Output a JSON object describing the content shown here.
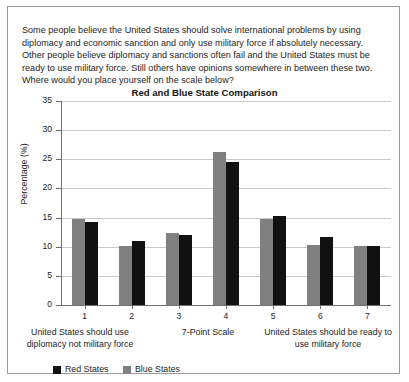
{
  "prompt": "Some people believe the United States should solve international problems by using diplomacy and economic sanction and only use military force if absolutely necessary. Other people believe diplomacy and sanctions often fail and the United States must be ready to use military force. Still others have opinions somewhere in between these two. Where would you place yourself on the scale below?",
  "captions": {
    "left": "United States should use diplomacy not military force",
    "center": "7-Point Scale",
    "right": "United States should be ready to use military force"
  },
  "legend": {
    "red_label": "Red States",
    "blue_label": "Blue States",
    "red_color": "#111111",
    "blue_color": "#808080"
  },
  "chart_data": {
    "type": "bar",
    "title": "Red and Blue State Comparison",
    "xlabel": "7-Point Scale",
    "ylabel": "Percentage (%)",
    "categories": [
      "1",
      "2",
      "3",
      "4",
      "5",
      "6",
      "7"
    ],
    "ylim": [
      0,
      35
    ],
    "yticks": [
      0,
      5,
      10,
      15,
      20,
      25,
      30,
      35
    ],
    "grid": true,
    "legend_position": "bottom-left",
    "series": [
      {
        "name": "Blue States",
        "color": "#808080",
        "values": [
          14.7,
          10.2,
          12.4,
          26.2,
          14.7,
          10.3,
          10.1
        ]
      },
      {
        "name": "Red States",
        "color": "#111111",
        "values": [
          14.3,
          10.9,
          12.0,
          24.5,
          15.2,
          11.7,
          10.1
        ]
      }
    ]
  }
}
